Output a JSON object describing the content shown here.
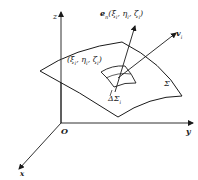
{
  "diagram": {
    "axes": {
      "z_label": "z",
      "y_label": "y",
      "x_label": "x",
      "origin_label": "O"
    },
    "surface_label": "Σ",
    "patch_label": "ΔΣ",
    "patch_subscript": "i",
    "point_label": "(ξ, η, ζ)",
    "point_label_text": "(ξ",
    "point_parts": [
      "(ξ",
      "i",
      ", η",
      "i",
      ", ζ",
      "i",
      ")"
    ],
    "normal_vector": {
      "symbol": "e",
      "subscript": "n",
      "args": [
        "(ξ",
        "i",
        ", η",
        "i",
        ", ζ",
        "i",
        ")"
      ]
    },
    "velocity_vector": {
      "symbol": "v",
      "subscript": "i"
    },
    "colors": {
      "stroke": "#1a1a1a",
      "background": "#ffffff"
    }
  }
}
